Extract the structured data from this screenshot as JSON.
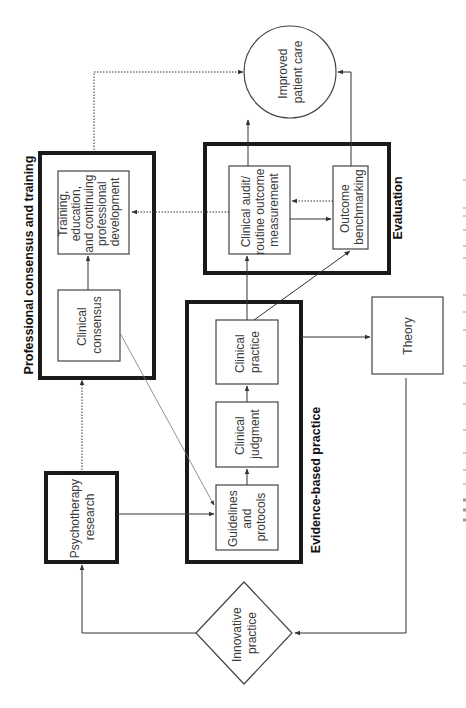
{
  "diagram": {
    "orientation": "rotated-90-clockwise",
    "groups": {
      "professional": {
        "label": "Professional consensus and training"
      },
      "evaluation": {
        "label": "Evaluation"
      },
      "ebp": {
        "label": "Evidence-based practice"
      }
    },
    "nodes": {
      "improved_care": {
        "lines": [
          "Improved",
          "patient care"
        ]
      },
      "training": {
        "lines": [
          "Training,",
          "education,",
          "and continuing",
          "professional",
          "development"
        ]
      },
      "clinical_consensus": {
        "lines": [
          "Clinical",
          "consensus"
        ]
      },
      "clinical_audit": {
        "lines": [
          "Clinical audit/",
          "routine outcome",
          "measurement"
        ]
      },
      "outcome_benchmarking": {
        "lines": [
          "Outcome",
          "benchmarking"
        ]
      },
      "guidelines": {
        "lines": [
          "Guidelines",
          "and",
          "protocols"
        ]
      },
      "clinical_judgment": {
        "lines": [
          "Clinical",
          "judgment"
        ]
      },
      "clinical_practice": {
        "lines": [
          "Clinical",
          "practice"
        ]
      },
      "theory": {
        "lines": [
          "Theory"
        ]
      },
      "psychotherapy_research": {
        "lines": [
          "Psychotherapy",
          "research"
        ]
      },
      "innovative_practice": {
        "lines": [
          "Innovative",
          "practice"
        ]
      }
    },
    "colors": {
      "thick_border": "#1a1a1a",
      "thin_border": "#444444",
      "text": "#3a3a3a",
      "dotted": "#555555"
    }
  }
}
